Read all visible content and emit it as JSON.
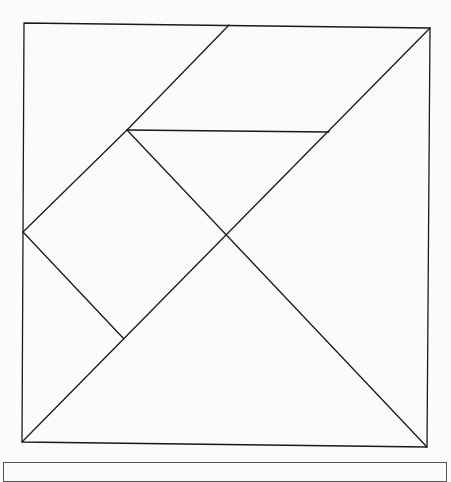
{
  "diagram": {
    "type": "tangram",
    "stroke_color": "#1a1a1a",
    "background_color": "#fbfbfa",
    "outer_square": [
      [
        24,
        23
      ],
      [
        430,
        28
      ],
      [
        427,
        447
      ],
      [
        22,
        442
      ]
    ],
    "segments": [
      {
        "name": "parallelogram-left-edge",
        "from": [
          229,
          25
        ],
        "to": [
          127,
          130
        ]
      },
      {
        "name": "main-diagonal",
        "from": [
          430,
          28
        ],
        "to": [
          22,
          442
        ]
      },
      {
        "name": "mid-horizontal",
        "from": [
          127,
          130
        ],
        "to": [
          329,
          132
        ]
      },
      {
        "name": "center-to-bottom-right",
        "from": [
          127,
          130
        ],
        "to": [
          427,
          447
        ]
      },
      {
        "name": "square-upper-left-edge",
        "from": [
          23,
          232
        ],
        "to": [
          127,
          130
        ]
      },
      {
        "name": "square-lower-left-edge",
        "from": [
          23,
          232
        ],
        "to": [
          124,
          339
        ]
      }
    ],
    "pieces": [
      {
        "name": "parallelogram",
        "points": [
          [
            229,
            25
          ],
          [
            430,
            28
          ],
          [
            329,
            132
          ],
          [
            127,
            130
          ]
        ]
      },
      {
        "name": "top-left-large-triangle",
        "points": [
          [
            24,
            23
          ],
          [
            229,
            25
          ],
          [
            127,
            130
          ],
          [
            23,
            232
          ]
        ]
      },
      {
        "name": "medium-triangle",
        "points": [
          [
            127,
            130
          ],
          [
            329,
            132
          ],
          [
            228,
            234
          ]
        ]
      },
      {
        "name": "square",
        "points": [
          [
            127,
            130
          ],
          [
            228,
            234
          ],
          [
            124,
            339
          ],
          [
            23,
            232
          ]
        ]
      },
      {
        "name": "small-triangle-left",
        "points": [
          [
            23,
            232
          ],
          [
            124,
            339
          ],
          [
            22,
            442
          ]
        ]
      },
      {
        "name": "large-triangle-bottom",
        "points": [
          [
            22,
            442
          ],
          [
            228,
            234
          ],
          [
            427,
            447
          ]
        ]
      },
      {
        "name": "large-triangle-right",
        "points": [
          [
            430,
            28
          ],
          [
            427,
            447
          ],
          [
            228,
            234
          ]
        ]
      }
    ]
  }
}
